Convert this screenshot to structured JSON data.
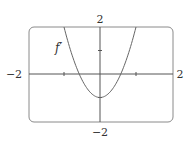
{
  "chart_data": {
    "type": "line",
    "title": "",
    "xlabel": "",
    "ylabel": "",
    "xlim": [
      -2,
      2
    ],
    "ylim": [
      -2,
      2
    ],
    "grid": false,
    "tick_labels": {
      "x_left": "−2",
      "x_right": "2",
      "y_top": "2",
      "y_bottom": "−2"
    },
    "series": [
      {
        "name": "f′",
        "formula": "3x^2 - 1",
        "x": [
          -1,
          -0.75,
          -0.577,
          -0.5,
          -0.25,
          0,
          0.25,
          0.5,
          0.577,
          0.75,
          1
        ],
        "values": [
          2,
          0.69,
          0,
          -0.25,
          -0.81,
          -1,
          -0.81,
          -0.25,
          0,
          0.69,
          2
        ]
      }
    ],
    "annotations": [
      {
        "text": "f′",
        "x": -1.45,
        "y": 1.2
      }
    ],
    "colors": {
      "axes": "#555555",
      "curve": "#666666",
      "frame": "#888888"
    }
  }
}
